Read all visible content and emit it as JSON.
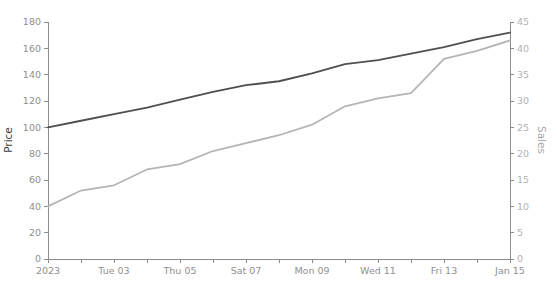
{
  "chart_data": {
    "type": "line",
    "title": "",
    "x": [
      1,
      2,
      3,
      4,
      5,
      6,
      7,
      8,
      9,
      10,
      11,
      12,
      13,
      14,
      15
    ],
    "x_unit": "day of January 2023",
    "x_tick_labels": [
      "2023",
      "Tue 03",
      "Thu 05",
      "Sat 07",
      "Mon 09",
      "Wed 11",
      "Fri 13",
      "Jan 15"
    ],
    "series": [
      {
        "name": "Price",
        "y_axis": "left",
        "color": "#4f4f4f",
        "line_width": 1.8,
        "values": [
          100,
          105,
          110,
          115,
          121,
          127,
          132,
          135,
          141,
          148,
          151,
          156,
          161,
          167,
          172
        ]
      },
      {
        "name": "Sales",
        "y_axis": "right",
        "color": "#b5b5b5",
        "line_width": 1.8,
        "values": [
          10,
          13,
          14,
          17,
          18,
          20.5,
          22,
          23.5,
          25.5,
          29,
          30.5,
          31.5,
          38,
          39.5,
          41.5
        ]
      }
    ],
    "axes": {
      "left": {
        "label": "Price",
        "min": 0,
        "max": 180,
        "tick_step": 20,
        "tick_labels": [
          "0",
          "20",
          "40",
          "60",
          "80",
          "100",
          "120",
          "140",
          "160",
          "180"
        ],
        "label_color": "#3c3c3c",
        "tick_label_color": "#8f8f8f"
      },
      "right": {
        "label": "Sales",
        "min": 0,
        "max": 45,
        "tick_step": 5,
        "tick_labels": [
          "0",
          "5",
          "10",
          "15",
          "20",
          "25",
          "30",
          "35",
          "40",
          "45"
        ],
        "label_color": "#a8a8a8",
        "tick_label_color": "#b2b2b2"
      },
      "bottom": {
        "tick_days": [
          1,
          2,
          3,
          4,
          5,
          6,
          7,
          8,
          9,
          10,
          11,
          12,
          13,
          14,
          15
        ],
        "labeled_days": [
          1,
          3,
          5,
          7,
          9,
          11,
          13,
          15
        ],
        "tick_label_color": "#8f8f8f"
      }
    },
    "grid": "off",
    "legend": "none",
    "background": "#ffffff",
    "axis_line_color": "#8c8c8c"
  }
}
